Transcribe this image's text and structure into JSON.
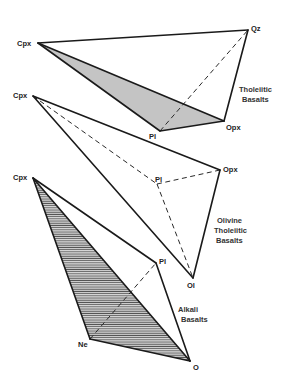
{
  "diagram": {
    "type": "mineral tetrahedra (basalt classification)",
    "tetrahedra": [
      {
        "name": "Tholeiitic Basalts",
        "caption_lines": [
          "Tholeiitic",
          "Basalts"
        ],
        "vertices": {
          "Cpx": {
            "label": "Cpx",
            "x": 38,
            "y": 43
          },
          "Qz": {
            "label": "Qz",
            "x": 248,
            "y": 30
          },
          "Pl": {
            "label": "Pl",
            "x": 160,
            "y": 131
          },
          "Opx": {
            "label": "Opx",
            "x": 224,
            "y": 121
          }
        },
        "shaded_face": [
          "Cpx",
          "Pl",
          "Opx"
        ],
        "shading": "gray fill",
        "solid_edges": [
          [
            "Cpx",
            "Qz"
          ],
          [
            "Qz",
            "Opx"
          ],
          [
            "Cpx",
            "Pl"
          ],
          [
            "Pl",
            "Opx"
          ],
          [
            "Cpx",
            "Opx"
          ]
        ],
        "dashed_edges": [
          [
            "Pl",
            "Qz"
          ]
        ]
      },
      {
        "name": "Olivine Tholeiitic Basalts",
        "caption_lines": [
          "Olivine",
          "Tholeiitic",
          "Basalts"
        ],
        "vertices": {
          "Cpx": {
            "label": "Cpx",
            "x": 33,
            "y": 96
          },
          "Opx": {
            "label": "Opx",
            "x": 220,
            "y": 170
          },
          "Pl": {
            "label": "Pl",
            "x": 157,
            "y": 184
          },
          "Ol": {
            "label": "Ol",
            "x": 193,
            "y": 278
          }
        },
        "shaded_face": null,
        "solid_edges": [
          [
            "Cpx",
            "Opx"
          ],
          [
            "Opx",
            "Ol"
          ],
          [
            "Cpx",
            "Ol"
          ]
        ],
        "dashed_edges": [
          [
            "Cpx",
            "Pl"
          ],
          [
            "Pl",
            "Opx"
          ],
          [
            "Pl",
            "Ol"
          ]
        ]
      },
      {
        "name": "Alkali Basalts",
        "caption_lines": [
          "Alkali",
          "Basalts"
        ],
        "vertices": {
          "Cpx": {
            "label": "Cpx",
            "x": 33,
            "y": 178
          },
          "Pl": {
            "label": "Pl",
            "x": 156,
            "y": 263
          },
          "Ne": {
            "label": "Ne",
            "x": 90,
            "y": 339
          },
          "O": {
            "label": "O",
            "x": 190,
            "y": 361
          }
        },
        "shaded_face": [
          "Cpx",
          "Ne",
          "O"
        ],
        "shading": "horizontal hatching",
        "solid_edges": [
          [
            "Cpx",
            "Pl"
          ],
          [
            "Pl",
            "O"
          ],
          [
            "Cpx",
            "Ne"
          ],
          [
            "Ne",
            "O"
          ],
          [
            "Cpx",
            "O"
          ]
        ],
        "dashed_edges": [
          [
            "Ne",
            "Pl"
          ]
        ]
      }
    ]
  },
  "labels": {
    "t1": {
      "cpx": "Cpx",
      "qz": "Qz",
      "pl": "Pl",
      "opx": "Opx",
      "cap1": "Tholeiitic",
      "cap2": "Basalts"
    },
    "t2": {
      "cpx": "Cpx",
      "opx": "Opx",
      "pl": "Pl",
      "ol": "Ol",
      "cap1": "Olivine",
      "cap2": "Tholeiitic",
      "cap3": "Basalts"
    },
    "t3": {
      "cpx": "Cpx",
      "pl": "Pl",
      "ne": "Ne",
      "o": "O",
      "cap1": "Alkali",
      "cap2": "Basalts"
    }
  },
  "colors": {
    "background": "#ffffff",
    "line": "#1a1a1a",
    "gray_fill": "#c4c4c4",
    "hatch": "#555555"
  }
}
